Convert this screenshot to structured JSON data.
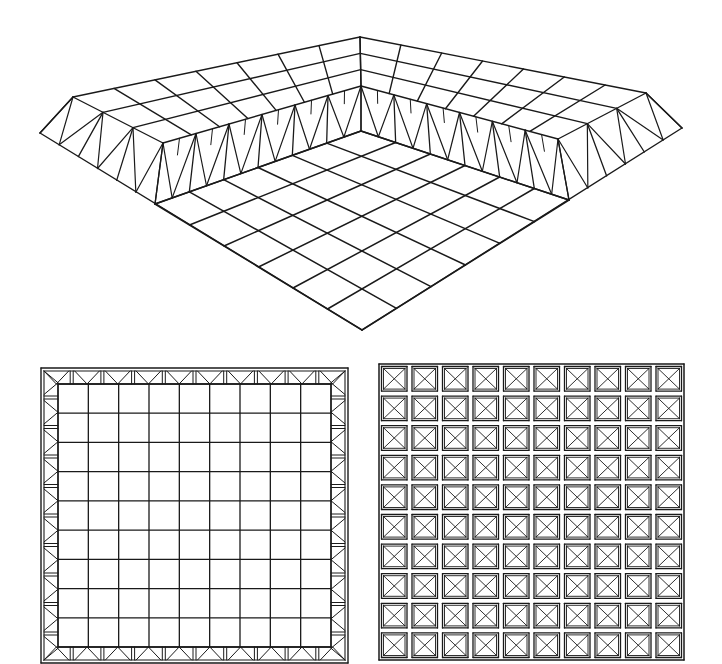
{
  "figure": {
    "stroke_color": "#1a1a1a",
    "background": "#ffffff"
  },
  "perspective_view": {
    "points": {
      "top_left_outer": [
        73,
        97
      ],
      "top_back_outer": [
        360,
        37
      ],
      "top_right_outer": [
        646,
        93
      ],
      "top_inner_corner": [
        361,
        86
      ],
      "top_left_inner_end": [
        163,
        143
      ],
      "top_right_inner_end": [
        558,
        139
      ],
      "bottom_left_outer": [
        40,
        133
      ],
      "bottom_right_outer": [
        682,
        128
      ],
      "floor_back": [
        361,
        131
      ],
      "floor_left": [
        155,
        204
      ],
      "floor_right": [
        569,
        200
      ],
      "floor_front": [
        362,
        330
      ]
    },
    "band_depth_cells": 3,
    "side_modules": 10,
    "floor_cells": 6
  },
  "plan_bottom_layer": {
    "x": 41,
    "y": 368,
    "width": 307,
    "height": 295,
    "frame_modules_per_side": 10,
    "inner_grid_cells": 9
  },
  "plan_top_layer": {
    "x": 379,
    "y": 364,
    "width": 305,
    "height": 296,
    "cells": 10
  }
}
